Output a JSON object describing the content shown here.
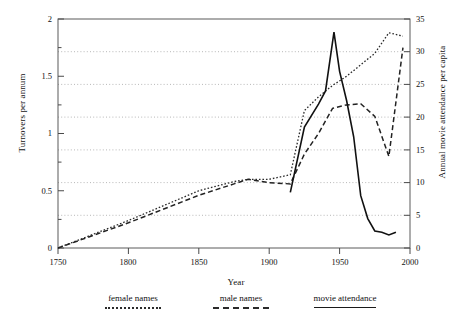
{
  "chart_data": {
    "type": "line",
    "title": "",
    "xlabel": "Year",
    "ylabel": "Turnovers per annum",
    "ylabel_right": "Annual movie attendance per capita",
    "xlim": [
      1750,
      2000
    ],
    "ylim": [
      0,
      2
    ],
    "ylim_right": [
      0,
      35
    ],
    "xticks": [
      1750,
      1800,
      1850,
      1900,
      1950,
      2000
    ],
    "xtick_labels": [
      "1750",
      "1800",
      "1850",
      "1900",
      "1950",
      "2000"
    ],
    "yticks_left": [
      0,
      0.5,
      1,
      1.5,
      2
    ],
    "ytick_labels_left": [
      "0",
      "0.5",
      "1",
      "1.5",
      "2"
    ],
    "yticks_right": [
      0,
      5,
      10,
      15,
      20,
      25,
      30,
      35
    ],
    "ytick_labels_right": [
      "0",
      "5",
      "10",
      "15",
      "20",
      "25",
      "30",
      "35"
    ],
    "grid": true,
    "grid_axis": "y-right",
    "grid_style": "dotted",
    "legend_position": "below",
    "series": [
      {
        "name": "female names",
        "style": "dotted",
        "axis": "left",
        "x": [
          1750,
          1800,
          1850,
          1875,
          1885,
          1900,
          1915,
          1925,
          1935,
          1945,
          1955,
          1965,
          1975,
          1985,
          1995
        ],
        "y": [
          0.0,
          0.24,
          0.5,
          0.58,
          0.6,
          0.6,
          0.64,
          1.2,
          1.32,
          1.42,
          1.5,
          1.6,
          1.7,
          1.88,
          1.85
        ]
      },
      {
        "name": "male names",
        "style": "dashed",
        "axis": "left",
        "x": [
          1750,
          1800,
          1850,
          1875,
          1885,
          1900,
          1915,
          1925,
          1935,
          1945,
          1955,
          1965,
          1975,
          1985,
          1995
        ],
        "y": [
          0.0,
          0.22,
          0.46,
          0.56,
          0.6,
          0.57,
          0.56,
          0.82,
          1.0,
          1.22,
          1.25,
          1.26,
          1.15,
          0.8,
          1.75
        ]
      },
      {
        "name": "movie attendance",
        "style": "solid",
        "axis": "right",
        "x": [
          1915,
          1925,
          1935,
          1940,
          1946,
          1950,
          1955,
          1960,
          1965,
          1970,
          1975,
          1980,
          1985,
          1990
        ],
        "y": [
          8.5,
          18.5,
          22.0,
          24.0,
          33.0,
          27.0,
          22.5,
          17.0,
          8.0,
          4.5,
          2.6,
          2.4,
          2.0,
          2.4
        ]
      }
    ]
  },
  "legend": {
    "items": [
      {
        "label": "female names",
        "style": "dotted"
      },
      {
        "label": "male names",
        "style": "dashed"
      },
      {
        "label": "movie attendance",
        "style": "solid"
      }
    ]
  }
}
